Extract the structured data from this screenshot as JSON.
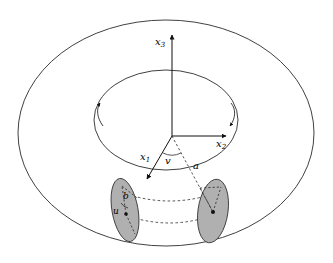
{
  "figure": {
    "background_color": "#ffffff",
    "stroke_color": "#1a1a1a",
    "disk_fill_color": "#b0b0b0",
    "disk_stroke_color": "#3a3a3a"
  },
  "axes": [
    {
      "name": "x3-axis",
      "label": "x",
      "subscript": "3",
      "direction": "up",
      "origin": [
        172,
        136
      ],
      "tip": [
        172,
        32
      ]
    },
    {
      "name": "x2-axis",
      "label": "x",
      "subscript": "2",
      "direction": "right",
      "origin": [
        172,
        136
      ],
      "tip": [
        228,
        136
      ]
    },
    {
      "name": "x1-axis",
      "label": "x",
      "subscript": "1",
      "direction": "lower-left-front",
      "origin": [
        172,
        136
      ],
      "tip": [
        146,
        180
      ]
    }
  ],
  "parameters": [
    {
      "name": "angle-v",
      "label": "v",
      "meaning": "toroidal angle measured at the center between the x1 direction and the radial line a"
    },
    {
      "name": "distance-a",
      "label": "a",
      "meaning": "distance from the torus center axis to the center of the tube"
    },
    {
      "name": "radius-b",
      "label": "b",
      "meaning": "radius of the tube (meridian circle)"
    },
    {
      "name": "angle-u",
      "label": "u",
      "meaning": "poloidal angle measured inside the meridian disk"
    }
  ],
  "shapes": {
    "outer_torus_ellipse": {
      "cx": 166,
      "cy": 133,
      "rx": 148,
      "ry": 113
    },
    "inner_hole_ellipse": {
      "cx": 166,
      "cy": 120,
      "rx": 72,
      "ry": 50
    },
    "left_meridian_disk": {
      "cx": 125,
      "cy": 210,
      "rx": 13,
      "ry": 32,
      "rotate": -10
    },
    "right_meridian_disk": {
      "cx": 213,
      "cy": 211,
      "rx": 15,
      "ry": 32,
      "rotate": 8
    },
    "dashed_tube_arcs": 2,
    "rotation_arrow_hooks": 2
  },
  "annotations": {
    "x3_label": "x",
    "x3_sub": "3",
    "x2_label": "x",
    "x2_sub": "2",
    "x1_label": "x",
    "x1_sub": "1",
    "v_label": "v",
    "a_label": "a",
    "b_label": "b",
    "u_label": "u"
  }
}
